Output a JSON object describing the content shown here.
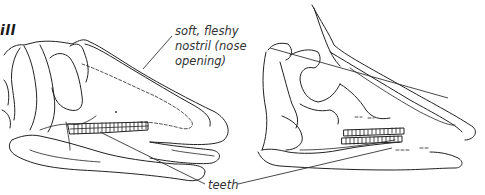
{
  "figure": {
    "heading": "ill",
    "labels": {
      "nostril_line1": "soft, fleshy",
      "nostril_line2": "nostril (nose",
      "nostril_line3": "opening)",
      "teeth": "teeth"
    },
    "subjects": [
      {
        "name": "left-skull",
        "description": "duck-billed dinosaur skull, flat bill"
      },
      {
        "name": "right-skull",
        "description": "crested dinosaur skull"
      }
    ]
  }
}
